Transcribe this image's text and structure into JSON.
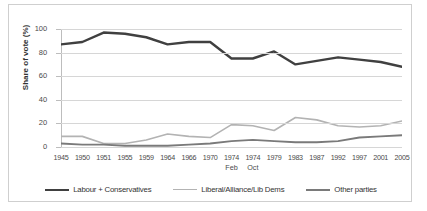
{
  "chart_data": {
    "type": "line",
    "title": "",
    "xlabel": "",
    "ylabel": "Share of vote (%)",
    "ylim": [
      0,
      100
    ],
    "yticks": [
      0,
      20,
      40,
      60,
      80,
      100
    ],
    "grid": true,
    "legend_position": "bottom",
    "categories": [
      "1945",
      "1950",
      "1951",
      "1955",
      "1959",
      "1964",
      "1966",
      "1970",
      "1974",
      "1974",
      "1979",
      "1983",
      "1987",
      "1992",
      "1997",
      "2001",
      "2005"
    ],
    "category_sublabels": [
      "",
      "",
      "",
      "",
      "",
      "",
      "",
      "",
      "Feb",
      "Oct",
      "",
      "",
      "",
      "",
      "",
      "",
      ""
    ],
    "series": [
      {
        "name": "Labour + Conservatives",
        "color": "#404040",
        "values": [
          87,
          89,
          97,
          96,
          93,
          87,
          89,
          89,
          75,
          75,
          81,
          70,
          73,
          76,
          74,
          72,
          68
        ]
      },
      {
        "name": "Liberal/Alliance/Lib Dems",
        "color": "#b3b3b3",
        "values": [
          9,
          9,
          3,
          3,
          6,
          11,
          9,
          8,
          19,
          18,
          14,
          25,
          23,
          18,
          17,
          18,
          22
        ]
      },
      {
        "name": "Other parties",
        "color": "#7a7a7a",
        "values": [
          3,
          2,
          2,
          1,
          1,
          1,
          2,
          3,
          5,
          6,
          5,
          4,
          4,
          5,
          8,
          9,
          10
        ]
      }
    ]
  },
  "legend": {
    "items": [
      {
        "label": "Labour + Conservatives",
        "color": "#404040",
        "width": 2.4
      },
      {
        "label": "Liberal/Alliance/Lib Dems",
        "color": "#b3b3b3",
        "width": 1.8
      },
      {
        "label": "Other parties",
        "color": "#7a7a7a",
        "width": 2.0
      }
    ]
  }
}
